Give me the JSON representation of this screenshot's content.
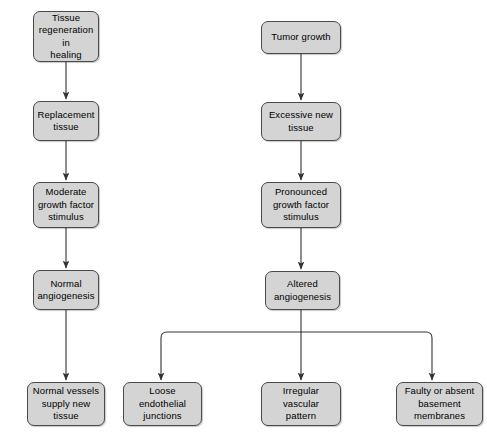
{
  "diagram": {
    "type": "flowchart",
    "background_color": "#ffffff",
    "node_fill_color": "#d4d4d4",
    "node_border_color": "#4a4a4a",
    "connector_color": "#333333",
    "caption_fragment": "",
    "columns": {
      "left_branch_label": "Tissue regeneration in healing",
      "right_branch_label": "Tumor growth"
    },
    "nodes": [
      {
        "id": "tissue-regeneration",
        "label": "Tissue\nregeneration in\nhealing",
        "x": 33,
        "y": 11,
        "w": 66,
        "h": 51
      },
      {
        "id": "replacement-tissue",
        "label": "Replacement\ntissue",
        "x": 33,
        "y": 101,
        "w": 66,
        "h": 40
      },
      {
        "id": "moderate-growth-factor-stimulus",
        "label": "Moderate\ngrowth factor\nstimulus",
        "x": 33,
        "y": 182,
        "w": 66,
        "h": 46
      },
      {
        "id": "normal-angiogenesis",
        "label": "Normal\nangiogenesis",
        "x": 33,
        "y": 270,
        "w": 66,
        "h": 40
      },
      {
        "id": "normal-vessels-supply-new-tissue",
        "label": "Normal vessels\nsupply new\ntissue",
        "x": 27,
        "y": 382,
        "w": 78,
        "h": 44
      },
      {
        "id": "tumor-growth",
        "label": "Tumor growth",
        "x": 261,
        "y": 21,
        "w": 80,
        "h": 33
      },
      {
        "id": "excessive-new-tissue",
        "label": "Excessive new\ntissue",
        "x": 261,
        "y": 102,
        "w": 80,
        "h": 39
      },
      {
        "id": "pronounced-growth-factor-stimulus",
        "label": "Pronounced\ngrowth factor\nstimulus",
        "x": 261,
        "y": 182,
        "w": 80,
        "h": 46
      },
      {
        "id": "altered-angiogenesis",
        "label": "Altered\nangiogenesis",
        "x": 265,
        "y": 271,
        "w": 75,
        "h": 39
      },
      {
        "id": "loose-endothelial-junctions",
        "label": "Loose\nendothelial\njunctions",
        "x": 123,
        "y": 382,
        "w": 79,
        "h": 44
      },
      {
        "id": "irregular-vascular-pattern",
        "label": "Irregular\nvascular\npattern",
        "x": 261,
        "y": 382,
        "w": 80,
        "h": 44
      },
      {
        "id": "faulty-or-absent-basement-membranes",
        "label": "Faulty or absent\nbasement\nmembranes",
        "x": 396,
        "y": 382,
        "w": 87,
        "h": 44
      }
    ],
    "connectors": [
      {
        "id": "arrow-regeneration-to-replacement",
        "from": "tissue-regeneration",
        "to": "replacement-tissue"
      },
      {
        "id": "arrow-replacement-to-moderate",
        "from": "replacement-tissue",
        "to": "moderate-growth-factor-stimulus"
      },
      {
        "id": "arrow-moderate-to-normal-angiogenesis",
        "from": "moderate-growth-factor-stimulus",
        "to": "normal-angiogenesis"
      },
      {
        "id": "arrow-normal-angiogenesis-to-normal-vessels",
        "from": "normal-angiogenesis",
        "to": "normal-vessels-supply-new-tissue"
      },
      {
        "id": "arrow-tumor-to-excessive",
        "from": "tumor-growth",
        "to": "excessive-new-tissue"
      },
      {
        "id": "arrow-excessive-to-pronounced",
        "from": "excessive-new-tissue",
        "to": "pronounced-growth-factor-stimulus"
      },
      {
        "id": "arrow-pronounced-to-altered",
        "from": "pronounced-growth-factor-stimulus",
        "to": "altered-angiogenesis"
      },
      {
        "id": "branch-altered-to-loose",
        "from": "altered-angiogenesis",
        "to": "loose-endothelial-junctions"
      },
      {
        "id": "branch-altered-to-irregular",
        "from": "altered-angiogenesis",
        "to": "irregular-vascular-pattern"
      },
      {
        "id": "branch-altered-to-faulty",
        "from": "altered-angiogenesis",
        "to": "faulty-or-absent-basement-membranes"
      }
    ]
  }
}
